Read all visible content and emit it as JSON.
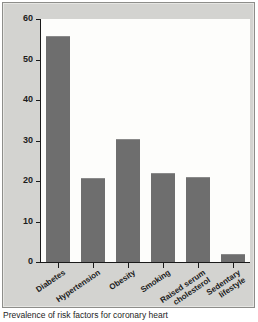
{
  "chart_data": {
    "type": "bar",
    "title": "",
    "xlabel": "",
    "ylabel": "Prevalence (%)",
    "ylim": [
      0,
      60
    ],
    "yticks": [
      0,
      10,
      20,
      30,
      40,
      50,
      60
    ],
    "grid": false,
    "legend": "none",
    "categories": [
      "Diabetes",
      "Hypertension",
      "Obesity",
      "Smoking",
      "Raised serum cholesterol",
      "Sedentary lifestyle"
    ],
    "category_lines": [
      [
        "Diabetes"
      ],
      [
        "Hypertension"
      ],
      [
        "Obesity"
      ],
      [
        "Smoking"
      ],
      [
        "Raised serum",
        "cholesterol"
      ],
      [
        "Sedentary",
        "lifestyle"
      ]
    ],
    "values": [
      55.8,
      20.8,
      30.4,
      22.0,
      21.0,
      2.1
    ],
    "bar_color": "#6e6e6e",
    "axis_color": "#1a1a1a",
    "plot_background": "#fdfdfb",
    "figure_background": "#d3d3d0"
  },
  "caption": {
    "text": "Prevalence of risk factors for coronary heart"
  }
}
